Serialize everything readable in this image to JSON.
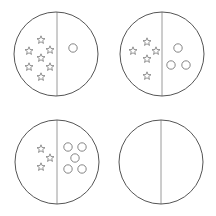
{
  "colors": {
    "outline": "#555555",
    "divider": "#9a9a9a",
    "shape": "#777777",
    "background": "#ffffff"
  },
  "panels": [
    {
      "id": "panel-1",
      "cx": 56,
      "cy": 54,
      "r": 42,
      "divider_x": 57,
      "star_count": 7,
      "circle_count": 1,
      "stars": [
        [
          41,
          40
        ],
        [
          29,
          51
        ],
        [
          50,
          50
        ],
        [
          41,
          58
        ],
        [
          29,
          67
        ],
        [
          50,
          67
        ],
        [
          41,
          77
        ]
      ],
      "circles": [
        [
          73,
          48
        ]
      ]
    },
    {
      "id": "panel-2",
      "cx": 162,
      "cy": 54,
      "r": 42,
      "divider_x": 162,
      "star_count": 5,
      "circle_count": 3,
      "stars": [
        [
          147,
          42
        ],
        [
          133,
          51
        ],
        [
          156,
          51
        ],
        [
          147,
          59
        ],
        [
          147,
          76
        ]
      ],
      "circles": [
        [
          178,
          48
        ],
        [
          171,
          65
        ],
        [
          186,
          65
        ]
      ]
    },
    {
      "id": "panel-3",
      "cx": 57,
      "cy": 162,
      "r": 42,
      "divider_x": 57,
      "star_count": 3,
      "circle_count": 5,
      "stars": [
        [
          41,
          149
        ],
        [
          50,
          158
        ],
        [
          41,
          167
        ]
      ],
      "circles": [
        [
          68,
          147
        ],
        [
          82,
          147
        ],
        [
          75,
          158
        ],
        [
          68,
          169
        ],
        [
          82,
          169
        ]
      ]
    },
    {
      "id": "panel-4",
      "cx": 161,
      "cy": 162,
      "r": 42,
      "divider_x": 161,
      "star_count": 0,
      "circle_count": 0,
      "stars": [],
      "circles": []
    }
  ]
}
